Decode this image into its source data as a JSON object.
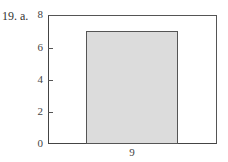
{
  "problem": {
    "label": "19. a."
  },
  "chart_data": {
    "type": "bar",
    "title": "",
    "xlabel": "",
    "ylabel": "",
    "categories": [
      "9"
    ],
    "values": [
      7
    ],
    "ylim": [
      0,
      8
    ],
    "yticks": [
      0,
      2,
      4,
      6,
      8
    ],
    "grid": false,
    "legend": null,
    "bar_color": "#dcdcdc",
    "edge_color": "#555555"
  },
  "axis": {
    "yticks": [
      "0",
      "2",
      "4",
      "6",
      "8"
    ],
    "xticks": [
      "9"
    ]
  }
}
